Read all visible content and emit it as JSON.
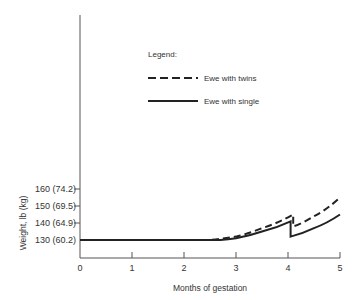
{
  "chart_data": {
    "type": "line",
    "title": "",
    "xlabel": "Months of gestation",
    "ylabel": "Weight, lb (kg)",
    "xlim": [
      0,
      5
    ],
    "ylim": [
      122,
      200
    ],
    "grid": false,
    "x_ticks": [
      "0",
      "1",
      "2",
      "3",
      "4",
      "5"
    ],
    "y_ticks": [
      {
        "value": 130,
        "label": "130 (60.2)"
      },
      {
        "value": 140,
        "label": "140 (64.9)"
      },
      {
        "value": 150,
        "label": "150 (69.5)"
      },
      {
        "value": 160,
        "label": "160 (74.2)"
      }
    ],
    "legend": {
      "title": "Legend:",
      "position": "upper center",
      "entries": [
        {
          "name": "Ewe with twins",
          "style": "dashed"
        },
        {
          "name": "Ewe with single",
          "style": "solid"
        }
      ]
    },
    "series": [
      {
        "name": "Ewe with twins",
        "style": "dashed",
        "points": [
          [
            0,
            130
          ],
          [
            2.5,
            130
          ],
          [
            3,
            132
          ],
          [
            3.5,
            137
          ],
          [
            4.1,
            145
          ],
          [
            4.1,
            138
          ],
          [
            4.5,
            144
          ],
          [
            5,
            155
          ]
        ]
      },
      {
        "name": "Ewe with single",
        "style": "solid",
        "points": [
          [
            0,
            130
          ],
          [
            2.7,
            130
          ],
          [
            3,
            131
          ],
          [
            3.5,
            135
          ],
          [
            4.05,
            141
          ],
          [
            4.05,
            132
          ],
          [
            4.5,
            137
          ],
          [
            5,
            145
          ]
        ]
      }
    ]
  }
}
